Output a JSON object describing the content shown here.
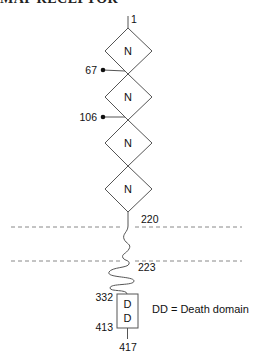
{
  "header": {
    "clipped_title": "MAP RECEPTOR"
  },
  "diagram": {
    "type": "protein-domain-schematic",
    "domains": [
      {
        "id": "n1",
        "label": "N",
        "shape": "diamond"
      },
      {
        "id": "n2",
        "label": "N",
        "shape": "diamond"
      },
      {
        "id": "n3",
        "label": "N",
        "shape": "diamond"
      },
      {
        "id": "n4",
        "label": "N",
        "shape": "diamond"
      },
      {
        "id": "dd",
        "label_top": "D",
        "label_bottom": "D",
        "shape": "rectangle"
      }
    ],
    "residues": {
      "start": "1",
      "glyco_1": "67",
      "glyco_2": "106",
      "tm_start": "220",
      "tm_end": "223",
      "dd_start": "332",
      "dd_end": "413",
      "end": "417"
    },
    "legend": "DD = Death domain",
    "colors": {
      "line": "#555555",
      "membrane_dash": "#888888",
      "text": "#111111"
    }
  }
}
